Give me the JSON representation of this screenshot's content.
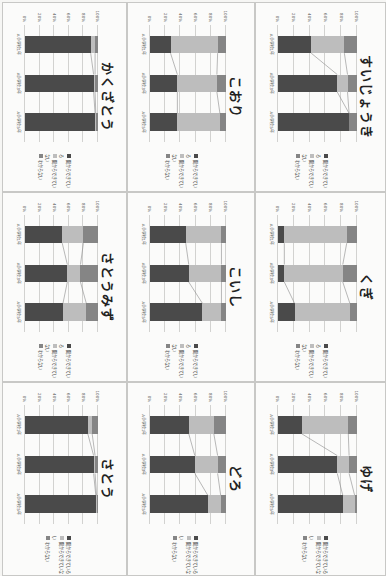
{
  "colors": {
    "can": "#4a4a4a",
    "cannot": "#bdbdbd",
    "unknown": "#858585",
    "grid": "#d2d2d0",
    "background": "#fbfbfa"
  },
  "legend": {
    "can": "聞からできている",
    "cannot": "聞からできていない",
    "unknown": "わからない"
  },
  "axis": {
    "ticks": [
      "0%",
      "20%",
      "40%",
      "60%",
      "80%",
      "100%"
    ]
  },
  "categories": [
    "A小学校1年",
    "A小学校3年",
    "A小学校5年"
  ],
  "chart_data": [
    {
      "type": "bar",
      "stacked": true,
      "title": "かくざとう",
      "categories": [
        "A小学校1年",
        "A小学校3年",
        "A小学校5年"
      ],
      "series": [
        {
          "name": "聞からできている",
          "values": [
            90,
            94,
            96
          ]
        },
        {
          "name": "聞からできていない",
          "values": [
            6,
            2,
            1
          ]
        },
        {
          "name": "わからない",
          "values": [
            4,
            4,
            3
          ]
        }
      ],
      "ylim": [
        0,
        100
      ]
    },
    {
      "type": "bar",
      "stacked": true,
      "title": "こおり",
      "categories": [
        "A小学校1年",
        "A小学校3年",
        "A小学校5年"
      ],
      "series": [
        {
          "name": "聞からできている",
          "values": [
            27,
            36,
            36
          ]
        },
        {
          "name": "聞からできていない",
          "values": [
            62,
            52,
            56
          ]
        },
        {
          "name": "わからない",
          "values": [
            11,
            12,
            8
          ]
        }
      ],
      "ylim": [
        0,
        100
      ]
    },
    {
      "type": "bar",
      "stacked": true,
      "title": "すいじょうき",
      "categories": [
        "A小学校1年",
        "A小学校3年",
        "A小学校5年"
      ],
      "series": [
        {
          "name": "聞からできている",
          "values": [
            42,
            75,
            90
          ]
        },
        {
          "name": "聞からできていない",
          "values": [
            42,
            13,
            0
          ]
        },
        {
          "name": "わからない",
          "values": [
            16,
            12,
            10
          ]
        }
      ],
      "ylim": [
        0,
        100
      ]
    },
    {
      "type": "bar",
      "stacked": true,
      "title": "さとうみず",
      "categories": [
        "A小学校1年",
        "A小学校3年",
        "A小学校5年"
      ],
      "series": [
        {
          "name": "聞からできている",
          "values": [
            51,
            58,
            52
          ]
        },
        {
          "name": "聞からできていない",
          "values": [
            29,
            18,
            32
          ]
        },
        {
          "name": "わからない",
          "values": [
            20,
            24,
            16
          ]
        }
      ],
      "ylim": [
        0,
        100
      ]
    },
    {
      "type": "bar",
      "stacked": true,
      "title": "こいし",
      "categories": [
        "A小学校1年",
        "A小学校3年",
        "A小学校5年"
      ],
      "series": [
        {
          "name": "聞からできている",
          "values": [
            47,
            51,
            69
          ]
        },
        {
          "name": "聞からできていない",
          "values": [
            47,
            43,
            25
          ]
        },
        {
          "name": "わからない",
          "values": [
            6,
            6,
            6
          ]
        }
      ],
      "ylim": [
        0,
        100
      ]
    },
    {
      "type": "bar",
      "stacked": true,
      "title": "くぎ",
      "categories": [
        "A小学校1年",
        "A小学校3年",
        "A小学校5年"
      ],
      "series": [
        {
          "name": "聞からできている",
          "values": [
            8,
            8,
            21
          ]
        },
        {
          "name": "聞からできていない",
          "values": [
            79,
            74,
            70
          ]
        },
        {
          "name": "わからない",
          "values": [
            13,
            18,
            9
          ]
        }
      ],
      "ylim": [
        0,
        100
      ]
    },
    {
      "type": "bar",
      "stacked": true,
      "title": "さとう",
      "categories": [
        "A小学校1年",
        "A小学校3年",
        "A小学校5年"
      ],
      "series": [
        {
          "name": "聞からできている",
          "values": [
            86,
            94,
            97
          ]
        },
        {
          "name": "聞からできていない",
          "values": [
            6,
            2,
            1
          ]
        },
        {
          "name": "わからない",
          "values": [
            8,
            4,
            2
          ]
        }
      ],
      "ylim": [
        0,
        100
      ]
    },
    {
      "type": "bar",
      "stacked": true,
      "title": "どろ",
      "categories": [
        "A小学校1年",
        "A小学校3年",
        "A小学校5年"
      ],
      "series": [
        {
          "name": "聞からできている",
          "values": [
            51,
            59,
            76
          ]
        },
        {
          "name": "聞からできていない",
          "values": [
            33,
            30,
            17
          ]
        },
        {
          "name": "わからない",
          "values": [
            16,
            11,
            7
          ]
        }
      ],
      "ylim": [
        0,
        100
      ]
    },
    {
      "type": "bar",
      "stacked": true,
      "title": "ゆげ",
      "categories": [
        "A小学校1年",
        "A小学校3年",
        "A小学校5年"
      ],
      "series": [
        {
          "name": "聞からできている",
          "values": [
            30,
            75,
            82
          ]
        },
        {
          "name": "聞からできていない",
          "values": [
            59,
            15,
            15
          ]
        },
        {
          "name": "わからない",
          "values": [
            11,
            10,
            3
          ]
        }
      ],
      "ylim": [
        0,
        100
      ]
    }
  ],
  "layout": [
    {
      "chart": 0,
      "x": 2,
      "y": 2,
      "w": 123,
      "h": 188
    },
    {
      "chart": 1,
      "x": 127,
      "y": 2,
      "w": 126,
      "h": 188
    },
    {
      "chart": 2,
      "x": 255,
      "y": 2,
      "w": 129,
      "h": 188
    },
    {
      "chart": 3,
      "x": 2,
      "y": 192,
      "w": 123,
      "h": 188
    },
    {
      "chart": 4,
      "x": 127,
      "y": 192,
      "w": 126,
      "h": 188
    },
    {
      "chart": 5,
      "x": 255,
      "y": 192,
      "w": 129,
      "h": 188
    },
    {
      "chart": 6,
      "x": 2,
      "y": 382,
      "w": 123,
      "h": 192
    },
    {
      "chart": 7,
      "x": 127,
      "y": 382,
      "w": 126,
      "h": 192
    },
    {
      "chart": 8,
      "x": 255,
      "y": 382,
      "w": 129,
      "h": 192
    }
  ]
}
